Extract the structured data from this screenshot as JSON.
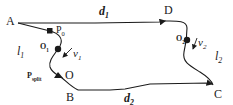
{
  "diagram": {
    "points": {
      "A": "A",
      "B": "B",
      "C": "C",
      "D": "D",
      "O": "O"
    },
    "markers": {
      "P0": {
        "base": "P",
        "sub": "0"
      },
      "O1": {
        "base": "O",
        "sub": "1"
      },
      "O2": {
        "base": "O",
        "sub": "2"
      },
      "Psplit": {
        "base": "P",
        "sub": "split"
      }
    },
    "segments": {
      "d1": {
        "base": "d",
        "sub": "1"
      },
      "d2": {
        "base": "d",
        "sub": "2"
      },
      "l1": {
        "base": "l",
        "sub": "1"
      },
      "l2": {
        "base": "l",
        "sub": "2"
      }
    },
    "velocities": {
      "v1": {
        "base": "v",
        "sub": "1"
      },
      "v2": {
        "base": "v",
        "sub": "2"
      }
    },
    "colors": {
      "stroke": "#1a1a1a",
      "background": "#ffffff"
    }
  }
}
